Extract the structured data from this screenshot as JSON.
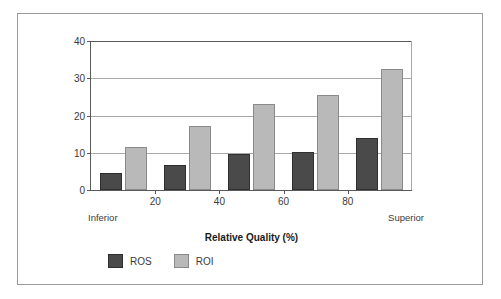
{
  "chart_data": {
    "type": "bar",
    "title": "",
    "xlabel": "Relative Quality (%)",
    "ylabel": "",
    "categories": [
      "10",
      "30",
      "50",
      "70",
      "90"
    ],
    "series": [
      {
        "name": "ROS",
        "color": "#4a4a4a",
        "values": [
          4.7,
          6.6,
          9.6,
          10.1,
          14.0
        ]
      },
      {
        "name": "ROI",
        "color": "#b9b9b9",
        "values": [
          11.5,
          17.2,
          23.0,
          25.4,
          32.5
        ]
      }
    ],
    "ylim": [
      0,
      40
    ],
    "y_ticks": [
      0,
      10,
      20,
      30,
      40
    ],
    "y_tick_labels": [
      "0",
      "10",
      "20",
      "30",
      "40"
    ],
    "x_ticks": [
      20,
      40,
      60,
      80
    ],
    "x_tick_labels": [
      "20",
      "40",
      "60",
      "80"
    ],
    "xlim": [
      0,
      100
    ],
    "x_end_labels": {
      "left": "Inferior",
      "right": "Superior"
    },
    "grid": true,
    "legend_position": "bottom-left",
    "legend": [
      {
        "label": "ROS",
        "color": "#4a4a4a"
      },
      {
        "label": "ROI",
        "color": "#b9b9b9"
      }
    ]
  },
  "frame": {
    "border_color": "#9a9a9a",
    "background": "#ffffff"
  }
}
